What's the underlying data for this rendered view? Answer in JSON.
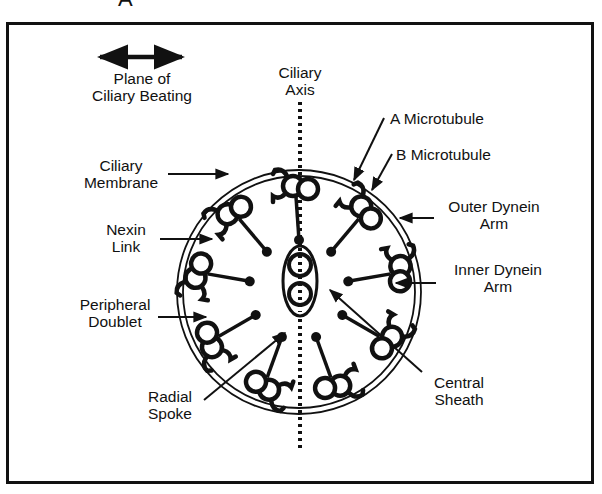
{
  "panel_letter": "A",
  "labels": {
    "plane": [
      "Plane of",
      "Ciliary Beating"
    ],
    "axis": [
      "Ciliary",
      "Axis"
    ],
    "a_microtubule": "A Microtubule",
    "b_microtubule": "B Microtubule",
    "membrane": [
      "Ciliary",
      "Membrane"
    ],
    "outer_dynein": [
      "Outer Dynein",
      "Arm"
    ],
    "nexin": [
      "Nexin",
      "Link"
    ],
    "inner_dynein": [
      "Inner Dynein",
      "Arm"
    ],
    "peripheral": [
      "Peripheral",
      "Doublet"
    ],
    "radial": [
      "Radial",
      "Spoke"
    ],
    "central": [
      "Central",
      "Sheath"
    ]
  },
  "structure": {
    "peripheral_doublets": 9,
    "central_pair": 2
  },
  "colors": {
    "ink": "#111111",
    "background": "#ffffff"
  }
}
